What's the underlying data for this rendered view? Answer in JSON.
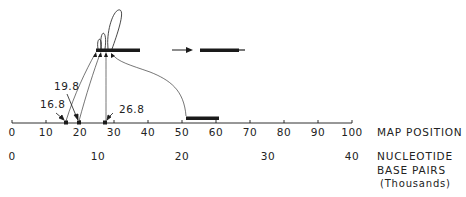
{
  "figure": {
    "axis_labels": {
      "map_position": "MAP POSITION",
      "nucleotide_line1": "NUCLEOTIDE",
      "nucleotide_line2": "BASE PAIRS",
      "nucleotide_line3": "(Thousands)"
    },
    "map_ticks": [
      "0",
      "10",
      "20",
      "30",
      "40",
      "50",
      "60",
      "70",
      "80",
      "90",
      "100"
    ],
    "nucleotide_ticks": [
      "0",
      "10",
      "20",
      "30",
      "40"
    ],
    "markers": [
      {
        "label": "16.8",
        "map_position": 16.8
      },
      {
        "label": "19.8",
        "map_position": 19.8
      },
      {
        "label": "26.8",
        "map_position": 26.8
      }
    ],
    "segment_on_axis": {
      "start": 51.5,
      "end": 61
    },
    "colors": {
      "ink": "#1a1a1a",
      "background": "#ffffff"
    }
  }
}
